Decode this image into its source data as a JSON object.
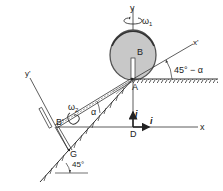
{
  "diagram": {
    "labels": {
      "y": "y",
      "omega1": "ω",
      "omega1_sub": "1",
      "B": "B",
      "x_prime": "x'",
      "angle_top": "45° − α",
      "A": "A",
      "y_prime": "y'",
      "omega2": "ω",
      "omega2_sub": "2",
      "B_prime": "B'",
      "alpha": "α",
      "j": "j",
      "i": "i",
      "x": "x",
      "D": "D",
      "G": "G",
      "angle_bottom": "45°"
    },
    "colors": {
      "line": "#333333",
      "disk_fill": "#c8c8c8",
      "disk_rim": "#555555",
      "background": "#ffffff"
    }
  }
}
